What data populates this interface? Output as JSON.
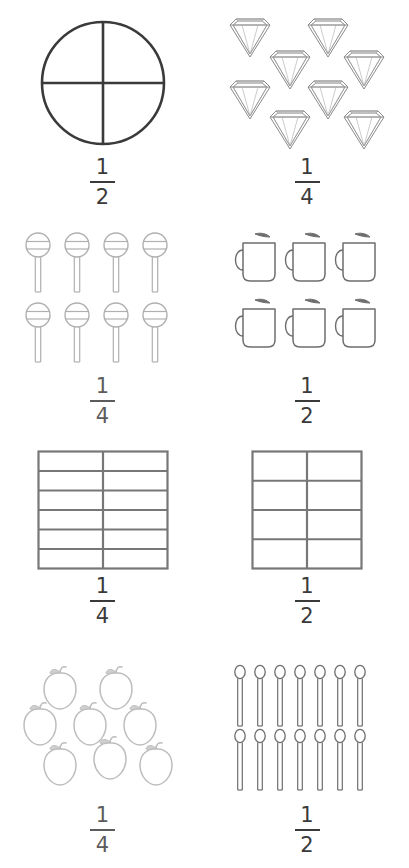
{
  "page": {
    "background_color": "#ffffff",
    "ink_dark": "#3a3a3a",
    "ink_mid": "#6e6e6e",
    "ink_light": "#b3b3b3"
  },
  "problems": [
    {
      "id": "problem-1",
      "position": "row1-left",
      "figure": "circle-quartered",
      "figure_label": "circle divided into 4 quarters",
      "object_count": 1,
      "rows": [
        1
      ],
      "fraction": {
        "numerator": "1",
        "denominator": "2"
      },
      "ink": "#3a3a3a"
    },
    {
      "id": "problem-2",
      "position": "row1-right",
      "figure": "diamonds",
      "figure_label": "diamonds staggered",
      "object_count": 8,
      "rows": [
        2,
        2,
        2,
        2
      ],
      "fraction": {
        "numerator": "1",
        "denominator": "4"
      },
      "ink": "#8a8a8a"
    },
    {
      "id": "problem-3",
      "position": "row2-left",
      "figure": "lollipops",
      "figure_label": "lollipops",
      "object_count": 8,
      "rows": [
        4,
        4
      ],
      "fraction": {
        "numerator": "1",
        "denominator": "4"
      },
      "ink": "#b0b0b0"
    },
    {
      "id": "problem-4",
      "position": "row2-right",
      "figure": "mugs",
      "figure_label": "steaming mugs",
      "object_count": 6,
      "rows": [
        3,
        3
      ],
      "fraction": {
        "numerator": "1",
        "denominator": "2"
      },
      "ink": "#6e6e6e"
    },
    {
      "id": "problem-5",
      "position": "row3-left",
      "figure": "grid",
      "figure_label": "rectangle grid 2 columns by 6 rows",
      "grid_columns": 2,
      "grid_rows": 6,
      "object_count": 12,
      "fraction": {
        "numerator": "1",
        "denominator": "4"
      },
      "ink": "#777777"
    },
    {
      "id": "problem-6",
      "position": "row3-right",
      "figure": "grid",
      "figure_label": "rectangle grid 2 columns by 4 rows",
      "grid_columns": 2,
      "grid_rows": 4,
      "object_count": 8,
      "fraction": {
        "numerator": "1",
        "denominator": "2"
      },
      "ink": "#777777"
    },
    {
      "id": "problem-7",
      "position": "row4-left",
      "figure": "apples",
      "figure_label": "apples staggered",
      "object_count": 8,
      "rows": [
        2,
        3,
        3
      ],
      "fraction": {
        "numerator": "1",
        "denominator": "4"
      },
      "ink": "#bdbdbd"
    },
    {
      "id": "problem-8",
      "position": "row4-right",
      "figure": "spoons",
      "figure_label": "spoons",
      "object_count": 14,
      "rows": [
        7,
        7
      ],
      "fraction": {
        "numerator": "1",
        "denominator": "2"
      },
      "ink": "#6e6e6e"
    }
  ]
}
